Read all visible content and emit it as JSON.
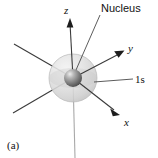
{
  "figure": {
    "panel_label": "(a)",
    "background_color": "#ffffff",
    "width": 158,
    "height": 158
  },
  "labels": {
    "nucleus": "Nucleus",
    "orbital": "1s",
    "axis_x": "x",
    "axis_y": "y",
    "axis_z": "z"
  },
  "colors": {
    "axis": "#3b3b3b",
    "axis_faint": "#a9a9a9",
    "leader": "#4a4a4a",
    "text": "#111111",
    "orbital_cloud_light": "#e8e8e8",
    "orbital_cloud_mid": "#d2d2d2",
    "orbital_cloud_edge": "#bdbdbd",
    "nucleus_highlight": "#e9e9e9",
    "nucleus_mid": "#8d8d8d",
    "nucleus_dark": "#4f4f4f"
  },
  "geometry": {
    "center": {
      "x": 73,
      "y": 78
    },
    "orbital_radius": 24,
    "nucleus_radius": 9,
    "axes": [
      {
        "name": "z-positive",
        "from": {
          "x": 73,
          "y": 78
        },
        "to": {
          "x": 70,
          "y": 20
        },
        "arrow": true,
        "style": "solid"
      },
      {
        "name": "z-negative",
        "from": {
          "x": 73,
          "y": 78
        },
        "to": {
          "x": 75,
          "y": 158
        },
        "arrow": false,
        "style": "faint"
      },
      {
        "name": "y-positive",
        "from": {
          "x": 73,
          "y": 78
        },
        "to": {
          "x": 124,
          "y": 51
        },
        "arrow": true,
        "style": "solid"
      },
      {
        "name": "y-negative",
        "from": {
          "x": 73,
          "y": 78
        },
        "to": {
          "x": 14,
          "y": 44
        },
        "arrow": false,
        "style": "solid"
      },
      {
        "name": "x-positive",
        "from": {
          "x": 73,
          "y": 78
        },
        "to": {
          "x": 119,
          "y": 114
        },
        "arrow": true,
        "style": "solid"
      },
      {
        "name": "x-negative",
        "from": {
          "x": 73,
          "y": 78
        },
        "to": {
          "x": 13,
          "y": 113
        },
        "arrow": false,
        "style": "solid"
      }
    ],
    "leaders": [
      {
        "name": "nucleus-leader",
        "from": {
          "x": 100,
          "y": 15
        },
        "to": {
          "x": 76,
          "y": 70
        }
      },
      {
        "name": "orbital-leader",
        "from": {
          "x": 133,
          "y": 79
        },
        "to": {
          "x": 94,
          "y": 82
        }
      }
    ],
    "label_positions": {
      "nucleus": {
        "x": 101,
        "y": 12
      },
      "orbital": {
        "x": 135,
        "y": 83
      },
      "axis_x": {
        "x": 124,
        "y": 125
      },
      "axis_y": {
        "x": 128,
        "y": 51
      },
      "axis_z": {
        "x": 65,
        "y": 14
      },
      "panel_label": {
        "x": 8,
        "y": 148
      }
    }
  }
}
